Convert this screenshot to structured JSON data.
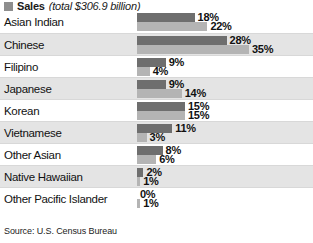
{
  "legend": {
    "items": [
      {
        "swatch_icon": "legend-swatch-icon",
        "label": "Sales",
        "sublabel": "(total $306.9 billion)",
        "color": "#8e8e8e"
      }
    ]
  },
  "source": {
    "text": "Source: U.S. Census Bureau"
  },
  "colors": {
    "series_a": "#6e6e6e",
    "series_b": "#b4b4b4",
    "band_light": "#ffffff",
    "band_dark": "#e4e4e4",
    "separator": "#d8d8d8",
    "text": "#111111"
  },
  "chart_data": {
    "type": "bar",
    "orientation": "horizontal",
    "title": "Sales (total $306.9 billion)",
    "subtitle": "",
    "xlabel": "",
    "ylabel": "",
    "xlim": [
      0,
      35
    ],
    "grid": false,
    "legend_position": "top-left",
    "axis_visible": false,
    "tick_labels": [],
    "value_suffix": "%",
    "categories": [
      "Asian Indian",
      "Chinese",
      "Filipino",
      "Japanese",
      "Korean",
      "Vietnamese",
      "Other Asian",
      "Native Hawaiian",
      "Other Pacific Islander"
    ],
    "series": [
      {
        "name": "Sales",
        "color": "#6e6e6e",
        "values": [
          18,
          28,
          9,
          9,
          15,
          11,
          8,
          2,
          0
        ],
        "labels": [
          "18%",
          "28%",
          "9%",
          "9%",
          "15%",
          "11%",
          "8%",
          "2%",
          "0%"
        ]
      },
      {
        "name": "Series 2",
        "color": "#b4b4b4",
        "values": [
          22,
          35,
          4,
          14,
          15,
          3,
          6,
          1,
          1
        ],
        "labels": [
          "22%",
          "35%",
          "4%",
          "14%",
          "15%",
          "3%",
          "6%",
          "1%",
          "1%"
        ]
      }
    ]
  }
}
